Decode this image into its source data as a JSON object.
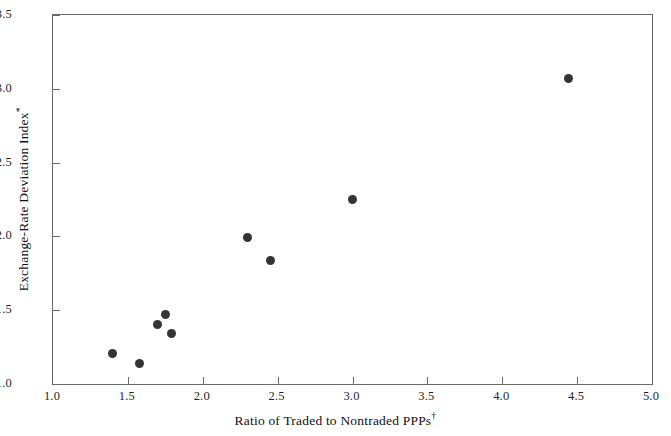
{
  "chart_data": {
    "type": "scatter",
    "title": "",
    "xlabel": "Ratio of Traded to Nontraded PPPs",
    "xlabel_marker": "†",
    "ylabel": "Exchange-Rate Deviation Index",
    "ylabel_marker": "*",
    "xlim": [
      1.0,
      5.0
    ],
    "ylim": [
      1.0,
      3.5
    ],
    "xticks": [
      1.0,
      1.5,
      2.0,
      2.5,
      3.0,
      3.5,
      4.0,
      4.5,
      5.0
    ],
    "xticklabels": [
      "1.0",
      "1.5",
      "2.0",
      "2.5",
      "3.0",
      "3.5",
      "4.0",
      "4.5",
      "5.0"
    ],
    "yticks": [
      1.0,
      1.5,
      2.0,
      2.5,
      3.0,
      3.5
    ],
    "yticklabels": [
      "1.0",
      "1.5",
      "2.0",
      "2.5",
      "3.0",
      "3.5"
    ],
    "grid": false,
    "legend": "none",
    "marker": "filled-circle",
    "marker_color": "#343434",
    "marker_size_px": 9,
    "frame_color": "#6a6a6a",
    "background_color": "#ffffff",
    "x": [
      1.4,
      1.58,
      1.7,
      1.75,
      1.79,
      2.3,
      2.45,
      3.0,
      4.44
    ],
    "y": [
      1.21,
      1.14,
      1.4,
      1.47,
      1.34,
      1.99,
      1.84,
      2.25,
      3.07
    ],
    "points": [
      {
        "x": 1.4,
        "y": 1.21
      },
      {
        "x": 1.58,
        "y": 1.14
      },
      {
        "x": 1.7,
        "y": 1.4
      },
      {
        "x": 1.75,
        "y": 1.47
      },
      {
        "x": 1.79,
        "y": 1.34
      },
      {
        "x": 2.3,
        "y": 1.99
      },
      {
        "x": 2.45,
        "y": 1.84
      },
      {
        "x": 3.0,
        "y": 2.25
      },
      {
        "x": 4.44,
        "y": 3.07
      }
    ]
  }
}
